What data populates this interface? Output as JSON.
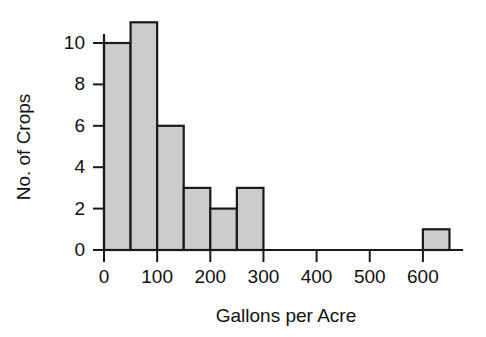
{
  "chart_data": {
    "type": "bar",
    "title": "",
    "subtitle": "",
    "xlabel": "Gallons per Acre",
    "ylabel": "No. of Crops",
    "xlim": [
      -20,
      670
    ],
    "ylim": [
      0,
      11.8
    ],
    "bin_width": 50,
    "grid": false,
    "legend": null,
    "annotations": [],
    "x_ticks": [
      0,
      100,
      200,
      300,
      400,
      500,
      600
    ],
    "x_tick_labels": [
      "0",
      "100",
      "200",
      "300",
      "400",
      "500",
      "600"
    ],
    "y_ticks": [
      0,
      2,
      4,
      6,
      8,
      10
    ],
    "y_tick_labels": [
      "0",
      "2",
      "4",
      "6",
      "8",
      "10"
    ],
    "categories": [
      "0-50",
      "50-100",
      "100-150",
      "150-200",
      "200-250",
      "250-300",
      "300-350",
      "350-400",
      "400-450",
      "450-500",
      "500-550",
      "550-600",
      "600-650"
    ],
    "values": [
      10,
      11,
      6,
      3,
      2,
      3,
      0,
      0,
      0,
      0,
      0,
      0,
      1
    ],
    "bins": [
      {
        "start": 0,
        "end": 50,
        "count": 10
      },
      {
        "start": 50,
        "end": 100,
        "count": 11
      },
      {
        "start": 100,
        "end": 150,
        "count": 6
      },
      {
        "start": 150,
        "end": 200,
        "count": 3
      },
      {
        "start": 200,
        "end": 250,
        "count": 2
      },
      {
        "start": 250,
        "end": 300,
        "count": 3
      },
      {
        "start": 300,
        "end": 350,
        "count": 0
      },
      {
        "start": 350,
        "end": 400,
        "count": 0
      },
      {
        "start": 400,
        "end": 450,
        "count": 0
      },
      {
        "start": 450,
        "end": 500,
        "count": 0
      },
      {
        "start": 500,
        "end": 550,
        "count": 0
      },
      {
        "start": 550,
        "end": 600,
        "count": 0
      },
      {
        "start": 600,
        "end": 650,
        "count": 1
      }
    ],
    "colors": {
      "bar_fill": "#cccccc",
      "bar_stroke": "#1a1a1a",
      "axis": "#1a1a1a",
      "text": "#111111",
      "background": "#ffffff"
    }
  }
}
